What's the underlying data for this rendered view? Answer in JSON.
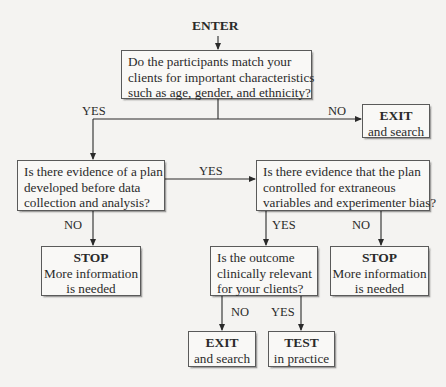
{
  "diagram": {
    "type": "flowchart",
    "start": "ENTER",
    "nodes": {
      "q1": {
        "lines": [
          "Do the participants match your",
          "clients for important characteristics",
          "such as age, gender, and ethnicity?"
        ]
      },
      "exit1": {
        "head": "EXIT",
        "sub": [
          "and search"
        ]
      },
      "q2": {
        "lines": [
          "Is there evidence of a plan",
          "developed before data",
          "collection and analysis?"
        ]
      },
      "q3": {
        "lines": [
          "Is there evidence that the plan",
          "controlled for extraneous",
          "variables and experimenter bias?"
        ]
      },
      "stop1": {
        "head": "STOP",
        "sub": [
          "More information",
          "is needed"
        ]
      },
      "q4": {
        "lines": [
          "Is the outcome",
          "clinically relevant",
          "for your clients?"
        ]
      },
      "stop2": {
        "head": "STOP",
        "sub": [
          "More information",
          "is needed"
        ]
      },
      "exit2": {
        "head": "EXIT",
        "sub": [
          "and search"
        ]
      },
      "test": {
        "head": "TEST",
        "sub": [
          "in practice"
        ]
      }
    },
    "edge_labels": {
      "q1_yes": "YES",
      "q1_no": "NO",
      "q2_yes": "YES",
      "q2_no": "NO",
      "q3_yes": "YES",
      "q3_no": "NO",
      "q4_no": "NO",
      "q4_yes": "YES"
    },
    "edges": [
      {
        "from": "ENTER",
        "to": "q1",
        "label": ""
      },
      {
        "from": "q1",
        "to": "q2",
        "label": "YES"
      },
      {
        "from": "q1",
        "to": "exit1",
        "label": "NO"
      },
      {
        "from": "q2",
        "to": "q3",
        "label": "YES"
      },
      {
        "from": "q2",
        "to": "stop1",
        "label": "NO"
      },
      {
        "from": "q3",
        "to": "q4",
        "label": "YES"
      },
      {
        "from": "q3",
        "to": "stop2",
        "label": "NO"
      },
      {
        "from": "q4",
        "to": "exit2",
        "label": "NO"
      },
      {
        "from": "q4",
        "to": "test",
        "label": "YES"
      }
    ]
  }
}
